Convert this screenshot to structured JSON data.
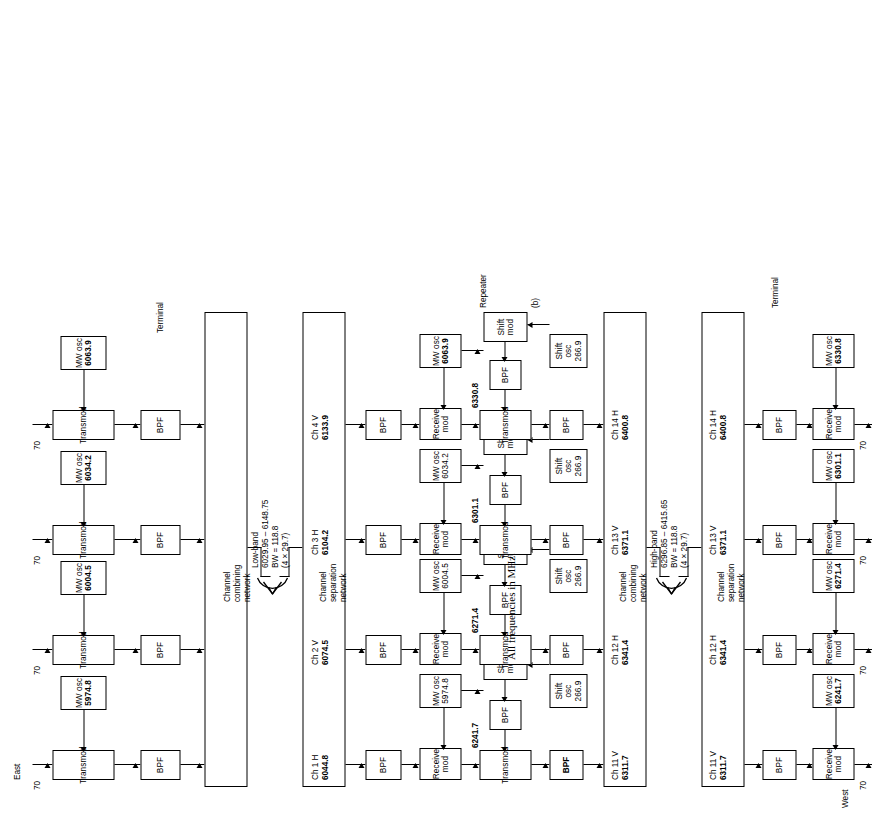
{
  "figure": {
    "caption": "All frequencies in MHz.",
    "part_label": "(b)",
    "section_labels": {
      "east": "East",
      "west": "West",
      "terminal_top": "Terminal",
      "terminal_bottom": "Terminal",
      "repeater": "Repeater"
    },
    "network_labels": {
      "combining": "Channel\ncombining\nnetwork",
      "separation": "Channel\nseparation\nnetwork"
    },
    "if_label": "70",
    "block_names": {
      "transmod": "Transmod",
      "receive_mod": "Receive\nmod",
      "shift_mod": "Shift\nmod",
      "bpf": "BPF",
      "mw_osc": "MW osc",
      "shift_osc": "Shift osc"
    }
  },
  "east_terminal": {
    "title": "Terminal",
    "side": "East",
    "columns": [
      {
        "if": "70",
        "transmod": "Transmod",
        "mw_osc": "5974.8",
        "bpf": "BPF",
        "channel": "Ch 1 H",
        "freq": "6044.8"
      },
      {
        "if": "70",
        "transmod": "Transmod",
        "mw_osc": "6004.5",
        "bpf": "BPF",
        "channel": "Ch 2 V",
        "freq": "6074.5"
      },
      {
        "if": "70",
        "transmod": "Transmod",
        "mw_osc": "6034.2",
        "bpf": "BPF",
        "channel": "Ch 3 H",
        "freq": "6104.2"
      },
      {
        "if": "70",
        "transmod": "Transmod",
        "mw_osc": "6063.9",
        "bpf": "BPF",
        "channel": "Ch 4 V",
        "freq": "6133.9"
      }
    ],
    "network": "Channel\ncombining\nnetwork"
  },
  "low_band": {
    "name": "Low-band",
    "range": "6029.95 – 6148.75",
    "bw": "BW = 118.8",
    "spacing": "(4 × 29.7)"
  },
  "high_band": {
    "name": "High-band",
    "range": "6296.85 – 6415.65",
    "bw": "BW = 118.8",
    "spacing": "(4 × 29.7)"
  },
  "repeater": {
    "title": "Repeater",
    "input_network": "Channel\nseparation\nnetwork",
    "output_network": "Channel\ncombining\nnetwork",
    "columns": [
      {
        "in_channel": "Ch 1 H",
        "in_freq": "6044.8",
        "bpf_in": "BPF",
        "receive_mod": "Receive\nmod",
        "mw_osc": "5974.8",
        "transmod": "Transmod",
        "tx_freq": "6241.7",
        "bpf_mid": "BPF",
        "shift_mod": "Shift\nmod",
        "shift_osc": "266.9",
        "bpf_out": "BPF",
        "out_channel": "Ch 11 V",
        "out_freq": "6311.7"
      },
      {
        "in_channel": "Ch 2 V",
        "in_freq": "6074.5",
        "bpf_in": "BPF",
        "receive_mod": "Receive\nmod",
        "mw_osc": "6004.5",
        "transmod": "Transmod",
        "tx_freq": "6271.4",
        "bpf_mid": "BPF",
        "shift_mod": "Shift\nmod",
        "shift_osc": "266.9",
        "bpf_out": "BPF",
        "out_channel": "Ch 12 H",
        "out_freq": "6341.4"
      },
      {
        "in_channel": "Ch 3 H",
        "in_freq": "6104.2",
        "bpf_in": "BPF",
        "receive_mod": "Receive\nmod",
        "mw_osc": "6034.2",
        "transmod": "Transmod",
        "tx_freq": "6301.1",
        "bpf_mid": "BPF",
        "shift_mod": "Shift\nmod",
        "shift_osc": "266.9",
        "bpf_out": "BPF",
        "out_channel": "Ch 13 V",
        "out_freq": "6371.1"
      },
      {
        "in_channel": "Ch 4 V",
        "in_freq": "6133.9",
        "bpf_in": "BPF",
        "receive_mod": "Receive\nmod",
        "mw_osc": "6063.9",
        "transmod": "Transmod",
        "tx_freq": "6330.8",
        "bpf_mid": "BPF",
        "shift_mod": "Shift\nmod",
        "shift_osc": "266.9",
        "bpf_out": "BPF",
        "out_channel": "Ch 14 H",
        "out_freq": "6400.8"
      }
    ]
  },
  "west_terminal": {
    "title": "Terminal",
    "side": "West",
    "network": "Channel\nseparation\nnetwork",
    "columns": [
      {
        "channel": "Ch 11 V",
        "freq": "6311.7",
        "bpf": "BPF",
        "receive_mod": "Receive\nmod",
        "mw_osc": "6241.7",
        "if": "70"
      },
      {
        "channel": "Ch 12 H",
        "freq": "6341.4",
        "bpf": "BPF",
        "receive_mod": "Receive\nmod",
        "mw_osc": "6271.4",
        "if": "70"
      },
      {
        "channel": "Ch 13 V",
        "freq": "6371.1",
        "bpf": "BPF",
        "receive_mod": "Receive\nmod",
        "mw_osc": "6301.1",
        "if": "70"
      },
      {
        "channel": "Ch 14 H",
        "freq": "6400.8",
        "bpf": "BPF",
        "receive_mod": "Receive\nmod",
        "mw_osc": "6330.8",
        "if": "70"
      }
    ]
  }
}
